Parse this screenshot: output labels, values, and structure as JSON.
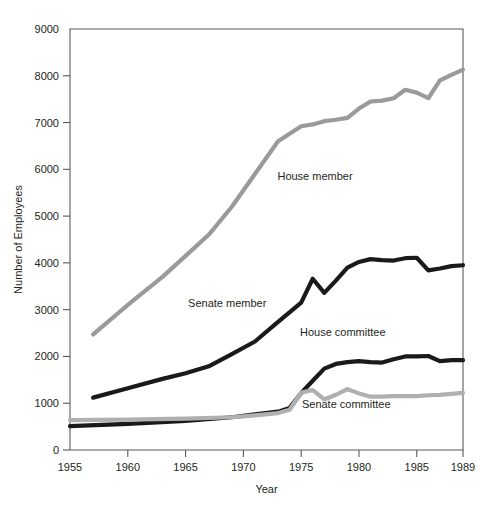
{
  "chart_data": {
    "type": "line",
    "title": "",
    "xlabel": "Year",
    "ylabel": "Number of Employees",
    "xlim": [
      1955,
      1989
    ],
    "ylim": [
      0,
      9000
    ],
    "grid": false,
    "legend_position": "inline-annotations",
    "xticks": [
      1955,
      1960,
      1965,
      1970,
      1975,
      1980,
      1985,
      1989
    ],
    "xtick_labels": [
      "1955",
      "1960",
      "1965",
      "1970",
      "1975",
      "1980",
      "1985",
      "1989"
    ],
    "yticks": [
      0,
      1000,
      2000,
      3000,
      4000,
      5000,
      6000,
      7000,
      8000,
      9000
    ],
    "ytick_labels": [
      "0",
      "1000",
      "2000",
      "3000",
      "4000",
      "5000",
      "6000",
      "7000",
      "8000",
      "9000"
    ],
    "series": [
      {
        "name": "House member",
        "color": "#9a9a9a",
        "width": 4.2,
        "label": "House member",
        "label_x": 1976.2,
        "label_y": 5780,
        "x": [
          1957,
          1960,
          1963,
          1965,
          1967,
          1969,
          1971,
          1973,
          1975,
          1976,
          1977,
          1978,
          1979,
          1980,
          1981,
          1982,
          1983,
          1984,
          1985,
          1986,
          1987,
          1988,
          1989
        ],
        "y": [
          2470,
          3100,
          3700,
          4150,
          4600,
          5200,
          5900,
          6600,
          6920,
          6960,
          7030,
          7060,
          7100,
          7300,
          7450,
          7470,
          7520,
          7700,
          7640,
          7520,
          7900,
          8020,
          8130
        ]
      },
      {
        "name": "Senate member",
        "color": "#1a1a1a",
        "width": 4.2,
        "label": "Senate member",
        "label_x": 1968.6,
        "label_y": 3060,
        "x": [
          1957,
          1960,
          1963,
          1965,
          1967,
          1969,
          1971,
          1973,
          1975,
          1976,
          1977,
          1978,
          1979,
          1980,
          1981,
          1982,
          1983,
          1984,
          1985,
          1986,
          1987,
          1988,
          1989
        ],
        "y": [
          1120,
          1320,
          1520,
          1640,
          1790,
          2050,
          2320,
          2740,
          3150,
          3660,
          3360,
          3620,
          3900,
          4020,
          4080,
          4060,
          4050,
          4100,
          4110,
          3840,
          3880,
          3930,
          3950
        ]
      },
      {
        "name": "House committee",
        "color": "#1a1a1a",
        "width": 4.2,
        "label": "House committee",
        "label_x": 1978.6,
        "label_y": 2440,
        "x": [
          1955,
          1960,
          1965,
          1969,
          1971,
          1973,
          1974,
          1975,
          1976,
          1977,
          1978,
          1979,
          1980,
          1981,
          1982,
          1983,
          1984,
          1985,
          1986,
          1987,
          1988,
          1989
        ],
        "y": [
          510,
          560,
          620,
          700,
          760,
          820,
          900,
          1220,
          1480,
          1740,
          1840,
          1880,
          1900,
          1880,
          1870,
          1940,
          2000,
          2000,
          2010,
          1900,
          1920,
          1920
        ]
      },
      {
        "name": "Senate committee",
        "color": "#b0b0b0",
        "width": 4.2,
        "label": "Senate committee",
        "label_x": 1978.9,
        "label_y": 900,
        "x": [
          1955,
          1960,
          1965,
          1969,
          1971,
          1973,
          1974,
          1975,
          1976,
          1977,
          1978,
          1979,
          1980,
          1981,
          1982,
          1983,
          1984,
          1985,
          1986,
          1987,
          1988,
          1989
        ],
        "y": [
          640,
          650,
          670,
          700,
          740,
          790,
          860,
          1230,
          1280,
          1080,
          1180,
          1300,
          1210,
          1140,
          1140,
          1150,
          1150,
          1150,
          1170,
          1180,
          1200,
          1220
        ]
      }
    ]
  },
  "figure": {
    "background": "#ffffff",
    "axis_color": "#58595b",
    "text_color": "#231f20"
  }
}
